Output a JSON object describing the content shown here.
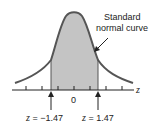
{
  "diagram": {
    "title_line1": "Standard",
    "title_line2": "normal curve",
    "axis_label": "z",
    "center_label": "0",
    "left_marker": {
      "var": "z",
      "eq": " = ",
      "value": "−1.47"
    },
    "right_marker": {
      "var": "z",
      "eq": " = ",
      "value": "1.47"
    },
    "colors": {
      "shade": "#c4c4c4",
      "curve": "#555555",
      "axis": "#222222"
    }
  }
}
